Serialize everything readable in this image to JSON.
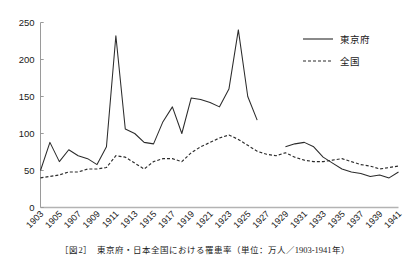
{
  "chart_data": {
    "type": "line",
    "title": "",
    "xlabel": "",
    "ylabel": "",
    "xlim": [
      1903,
      1941
    ],
    "ylim": [
      0,
      250
    ],
    "grid": false,
    "legend_position": "top-right",
    "y_ticks": [
      0,
      50,
      100,
      150,
      200,
      250
    ],
    "x_ticks": [
      1903,
      1905,
      1907,
      1909,
      1911,
      1913,
      1915,
      1917,
      1919,
      1921,
      1923,
      1925,
      1927,
      1929,
      1931,
      1933,
      1935,
      1937,
      1939,
      1941
    ],
    "x": [
      1903,
      1904,
      1905,
      1906,
      1907,
      1908,
      1909,
      1910,
      1911,
      1912,
      1913,
      1914,
      1915,
      1916,
      1917,
      1918,
      1919,
      1920,
      1921,
      1922,
      1923,
      1924,
      1925,
      1926,
      1927,
      1928,
      1929,
      1930,
      1931,
      1932,
      1933,
      1934,
      1935,
      1936,
      1937,
      1938,
      1939,
      1940,
      1941
    ],
    "series": [
      {
        "name": "東京府",
        "style": "solid",
        "color": "#2b2b2b",
        "values": [
          50,
          88,
          62,
          78,
          70,
          66,
          58,
          82,
          232,
          106,
          100,
          88,
          86,
          116,
          136,
          100,
          148,
          146,
          142,
          136,
          160,
          240,
          150,
          118,
          null,
          null,
          82,
          86,
          88,
          82,
          68,
          60,
          52,
          48,
          46,
          42,
          44,
          40,
          48
        ]
      },
      {
        "name": "全国",
        "style": "dashed",
        "color": "#2b2b2b",
        "values": [
          40,
          42,
          44,
          48,
          48,
          52,
          52,
          54,
          70,
          68,
          60,
          52,
          62,
          66,
          66,
          62,
          74,
          82,
          88,
          94,
          98,
          92,
          84,
          76,
          72,
          70,
          74,
          68,
          64,
          62,
          62,
          64,
          66,
          62,
          58,
          56,
          52,
          54,
          56
        ]
      }
    ]
  },
  "legend": {
    "entries": [
      {
        "label": "東京府",
        "style": "solid"
      },
      {
        "label": "全国",
        "style": "dashed"
      }
    ]
  },
  "caption": {
    "text": "［図2］　東京府・日本全国における罹患率（単位：万人／1903-1941年）"
  }
}
